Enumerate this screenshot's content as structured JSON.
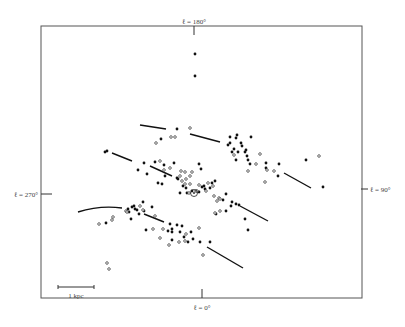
{
  "diagram": {
    "type": "scatter-map",
    "frame": {
      "x1": 41,
      "y1": 26,
      "x2": 362,
      "y2": 298
    },
    "axis_labels": {
      "top": "ℓ = 180°",
      "left": "ℓ = 270°",
      "right": "ℓ = 90°",
      "bottom": "ℓ = 0°"
    },
    "scale_bar": {
      "label": "1 kpc",
      "x1": 58,
      "x2": 94,
      "y": 287
    },
    "sun": {
      "x": 194,
      "y": 193
    },
    "arm_segments": [
      {
        "x1": 140,
        "y1": 125,
        "x2": 166,
        "y2": 129
      },
      {
        "x1": 190,
        "y1": 134,
        "x2": 220,
        "y2": 142
      },
      {
        "x1": 112,
        "y1": 153,
        "x2": 132,
        "y2": 161
      },
      {
        "x1": 150,
        "y1": 166,
        "x2": 172,
        "y2": 176
      },
      {
        "x1": 284,
        "y1": 173,
        "x2": 311,
        "y2": 188
      },
      {
        "x1": 240,
        "y1": 206,
        "x2": 268,
        "y2": 221
      },
      {
        "x1": 144,
        "y1": 214,
        "x2": 164,
        "y2": 222
      },
      {
        "x1": 207,
        "y1": 247,
        "x2": 243,
        "y2": 268
      }
    ],
    "arm_curve_left": "M78,212 Q100,205 122,208",
    "filled_points": [
      [
        195,
        54
      ],
      [
        195,
        76
      ],
      [
        177,
        129
      ],
      [
        161,
        139
      ],
      [
        237,
        135
      ],
      [
        236,
        138
      ],
      [
        230,
        137
      ],
      [
        230,
        143
      ],
      [
        228,
        145
      ],
      [
        241,
        143
      ],
      [
        251,
        137
      ],
      [
        234,
        149
      ],
      [
        232,
        152
      ],
      [
        238,
        152
      ],
      [
        242,
        146
      ],
      [
        246,
        150
      ],
      [
        245,
        152
      ],
      [
        247,
        156
      ],
      [
        248,
        160
      ],
      [
        236,
        160
      ],
      [
        250,
        164
      ],
      [
        266,
        163
      ],
      [
        266,
        168
      ],
      [
        279,
        164
      ],
      [
        278,
        176
      ],
      [
        306,
        160
      ],
      [
        323,
        187
      ],
      [
        105,
        152
      ],
      [
        107,
        151
      ],
      [
        144,
        163
      ],
      [
        138,
        170
      ],
      [
        147,
        174
      ],
      [
        155,
        162
      ],
      [
        164,
        165
      ],
      [
        165,
        176
      ],
      [
        174,
        163
      ],
      [
        158,
        183
      ],
      [
        162,
        184
      ],
      [
        178,
        179
      ],
      [
        199,
        164
      ],
      [
        201,
        169
      ],
      [
        177,
        178
      ],
      [
        183,
        186
      ],
      [
        186,
        188
      ],
      [
        180,
        193
      ],
      [
        187,
        193
      ],
      [
        192,
        191
      ],
      [
        202,
        187
      ],
      [
        205,
        189
      ],
      [
        199,
        192
      ],
      [
        204,
        186
      ],
      [
        210,
        188
      ],
      [
        215,
        181
      ],
      [
        212,
        183
      ],
      [
        223,
        200
      ],
      [
        226,
        194
      ],
      [
        232,
        202
      ],
      [
        216,
        214
      ],
      [
        226,
        211
      ],
      [
        231,
        206
      ],
      [
        236,
        204
      ],
      [
        239,
        205
      ],
      [
        245,
        219
      ],
      [
        248,
        230
      ],
      [
        132,
        207
      ],
      [
        135,
        209
      ],
      [
        134,
        206
      ],
      [
        129,
        212
      ],
      [
        143,
        202
      ],
      [
        152,
        207
      ],
      [
        144,
        211
      ],
      [
        139,
        214
      ],
      [
        131,
        219
      ],
      [
        106,
        223
      ],
      [
        170,
        224
      ],
      [
        172,
        229
      ],
      [
        177,
        225
      ],
      [
        182,
        226
      ],
      [
        168,
        231
      ],
      [
        172,
        232
      ],
      [
        180,
        232
      ],
      [
        172,
        240
      ],
      [
        184,
        237
      ],
      [
        191,
        232
      ],
      [
        188,
        242
      ],
      [
        193,
        239
      ],
      [
        200,
        242
      ],
      [
        210,
        242
      ],
      [
        146,
        230
      ],
      [
        128,
        209
      ],
      [
        137,
        210
      ]
    ],
    "open_points": [
      [
        190,
        128
      ],
      [
        171,
        137
      ],
      [
        175,
        137
      ],
      [
        156,
        143
      ],
      [
        234,
        155
      ],
      [
        260,
        154
      ],
      [
        256,
        164
      ],
      [
        248,
        171
      ],
      [
        267,
        170
      ],
      [
        274,
        171
      ],
      [
        319,
        156
      ],
      [
        160,
        161
      ],
      [
        164,
        170
      ],
      [
        170,
        168
      ],
      [
        181,
        171
      ],
      [
        185,
        172
      ],
      [
        180,
        176
      ],
      [
        192,
        172
      ],
      [
        190,
        176
      ],
      [
        186,
        179
      ],
      [
        182,
        181
      ],
      [
        185,
        184
      ],
      [
        190,
        184
      ],
      [
        199,
        185
      ],
      [
        208,
        183
      ],
      [
        213,
        186
      ],
      [
        206,
        191
      ],
      [
        196,
        191
      ],
      [
        189,
        193
      ],
      [
        197,
        191
      ],
      [
        214,
        196
      ],
      [
        219,
        198
      ],
      [
        217,
        201
      ],
      [
        220,
        199
      ],
      [
        220,
        211
      ],
      [
        215,
        213
      ],
      [
        265,
        182
      ],
      [
        126,
        211
      ],
      [
        140,
        206
      ],
      [
        143,
        210
      ],
      [
        155,
        216
      ],
      [
        127,
        212
      ],
      [
        113,
        217
      ],
      [
        112,
        220
      ],
      [
        99,
        224
      ],
      [
        153,
        229
      ],
      [
        163,
        229
      ],
      [
        186,
        234
      ],
      [
        185,
        241
      ],
      [
        179,
        242
      ],
      [
        199,
        228
      ],
      [
        160,
        238
      ],
      [
        169,
        245
      ],
      [
        203,
        255
      ],
      [
        107,
        263
      ],
      [
        109,
        269
      ]
    ]
  }
}
